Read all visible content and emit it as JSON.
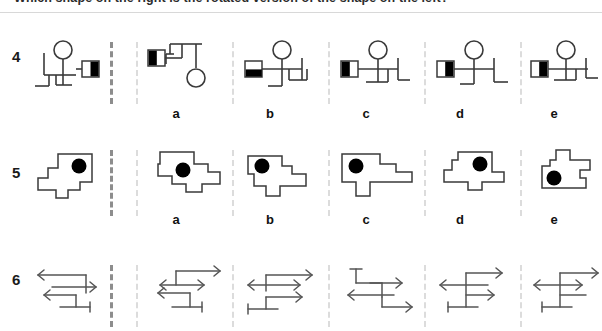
{
  "header": {
    "text": "Which shape on the right is the rotated version of the shape on the left?"
  },
  "colors": {
    "ink": "#1a1a1a",
    "stroke": "#3a3a3a",
    "fill_black": "#000000",
    "separator_main": "#8d8d8d",
    "separator_option": "#dcdcdc",
    "page_background": "#ffffff"
  },
  "option_letters": [
    "a",
    "b",
    "c",
    "d",
    "e"
  ],
  "rows": [
    {
      "number": "4",
      "type": "stick-figure-pedigree",
      "reference_name": "row-4-reference-figure",
      "description": "Line figure with an open circle, a half-filled square and branching stems",
      "options": [
        {
          "letter": "a",
          "name": "row-4-option-a"
        },
        {
          "letter": "b",
          "name": "row-4-option-b"
        },
        {
          "letter": "c",
          "name": "row-4-option-c"
        },
        {
          "letter": "d",
          "name": "row-4-option-d"
        },
        {
          "letter": "e",
          "name": "row-4-option-e"
        }
      ]
    },
    {
      "number": "5",
      "type": "polygon-with-dot",
      "reference_name": "row-5-reference-figure",
      "description": "Irregular stepped polygon containing a filled black dot",
      "options": [
        {
          "letter": "a",
          "name": "row-5-option-a"
        },
        {
          "letter": "b",
          "name": "row-5-option-b"
        },
        {
          "letter": "c",
          "name": "row-5-option-c"
        },
        {
          "letter": "d",
          "name": "row-5-option-d"
        },
        {
          "letter": "e",
          "name": "row-5-option-e"
        }
      ]
    },
    {
      "number": "6",
      "type": "arrow-lattice",
      "reference_name": "row-6-reference-figure",
      "description": "Lattice of connected line segments terminated by arrowheads and bars",
      "options": [
        {
          "letter": "",
          "name": "row-6-option-a"
        },
        {
          "letter": "",
          "name": "row-6-option-b"
        },
        {
          "letter": "",
          "name": "row-6-option-c"
        },
        {
          "letter": "",
          "name": "row-6-option-d"
        },
        {
          "letter": "",
          "name": "row-6-option-e"
        }
      ]
    }
  ],
  "layout": {
    "separator_main_x": 110,
    "option_x": [
      136,
      232,
      328,
      424,
      520
    ],
    "letter_x": [
      166,
      260,
      356,
      450,
      544
    ]
  }
}
